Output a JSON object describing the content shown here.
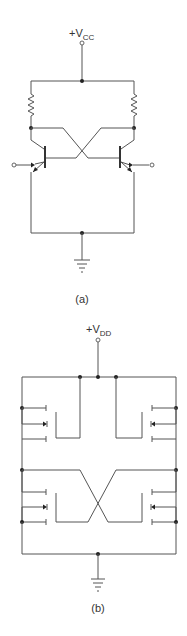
{
  "figure": {
    "panels": [
      {
        "id": "a",
        "caption": "(a)",
        "supply_label_main": "+V",
        "supply_label_sub": "CC",
        "description": "BJT cross-coupled latch with two collector resistors"
      },
      {
        "id": "b",
        "caption": "(b)",
        "supply_label_main": "+V",
        "supply_label_sub": "DD",
        "description": "MOSFET cross-coupled latch"
      }
    ],
    "colors": {
      "wire": "#555555",
      "node": "#222222",
      "text": "#333333",
      "background": "#ffffff"
    }
  }
}
